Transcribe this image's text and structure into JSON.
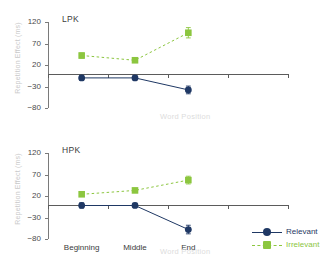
{
  "figure": {
    "xlabel": "Word Position",
    "ylabel": "Repetition Effect (ms)"
  },
  "legend": {
    "position": "bottom-right",
    "items": [
      {
        "label": "Relevant",
        "color": "#1F3864",
        "marker": "circle",
        "line": "solid"
      },
      {
        "label": "Irrelevant",
        "color": "#8CC63F",
        "marker": "square",
        "line": "dashed"
      }
    ]
  },
  "colors": {
    "relevant": "#1F3864",
    "irrelevant": "#8CC63F",
    "axis": "#5b5b5b",
    "tick_text": "#4a4a4a",
    "muted_text": "#dcdcdc",
    "ylabel_text": "#c9c9c9"
  },
  "chart_data": [
    {
      "type": "line",
      "title": "LPK",
      "xlabel": "Word Position",
      "ylabel": "Repetition Effect (ms)",
      "categories": [
        "Beginning",
        "Middle",
        "End"
      ],
      "yticks": [
        120,
        70,
        20,
        -30,
        -80
      ],
      "ylim": [
        -80,
        120
      ],
      "grid": false,
      "zero_line": true,
      "series": [
        {
          "name": "Relevant",
          "color": "#1F3864",
          "marker": "circle",
          "linestyle": "solid",
          "values": [
            -10,
            -10,
            -38
          ],
          "errors": [
            6,
            5,
            9
          ]
        },
        {
          "name": "Irrelevant",
          "color": "#8CC63F",
          "marker": "square",
          "linestyle": "dashed",
          "values": [
            42,
            31,
            95
          ],
          "errors": [
            6,
            5,
            12
          ]
        }
      ]
    },
    {
      "type": "line",
      "title": "HPK",
      "xlabel": "Word Position",
      "ylabel": "Repetition Effect (ms)",
      "categories": [
        "Beginning",
        "Middle",
        "End"
      ],
      "yticks": [
        120,
        70,
        20,
        -30,
        -80
      ],
      "ylim": [
        -80,
        120
      ],
      "grid": false,
      "zero_line": true,
      "series": [
        {
          "name": "Relevant",
          "color": "#1F3864",
          "marker": "circle",
          "linestyle": "solid",
          "values": [
            -2,
            -2,
            -58
          ],
          "errors": [
            6,
            5,
            10
          ]
        },
        {
          "name": "Irrelevant",
          "color": "#8CC63F",
          "marker": "square",
          "linestyle": "dashed",
          "values": [
            24,
            33,
            57
          ],
          "errors": [
            5,
            5,
            9
          ]
        }
      ]
    }
  ]
}
